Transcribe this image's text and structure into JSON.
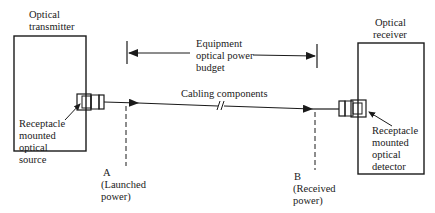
{
  "diagram": {
    "transmitter": {
      "label_lines": [
        "Optical",
        "transmitter"
      ],
      "source_label_lines": [
        "Receptacle",
        "mounted",
        "optical",
        "source"
      ]
    },
    "receiver": {
      "label_lines": [
        "Optical",
        "receiver"
      ],
      "detector_label_lines": [
        "Receptacle",
        "mounted",
        "optical",
        "detector"
      ]
    },
    "budget": {
      "label_lines": [
        "Equipment",
        "optical power",
        "budget"
      ]
    },
    "cabling": {
      "label": "Cabling components"
    },
    "point_a": {
      "label_lines": [
        "A",
        "(Launched",
        "power)"
      ]
    },
    "point_b": {
      "label_lines": [
        "B",
        "(Received",
        "power)"
      ]
    },
    "colors": {
      "line": "#1a1a1a",
      "background": "#ffffff"
    }
  }
}
